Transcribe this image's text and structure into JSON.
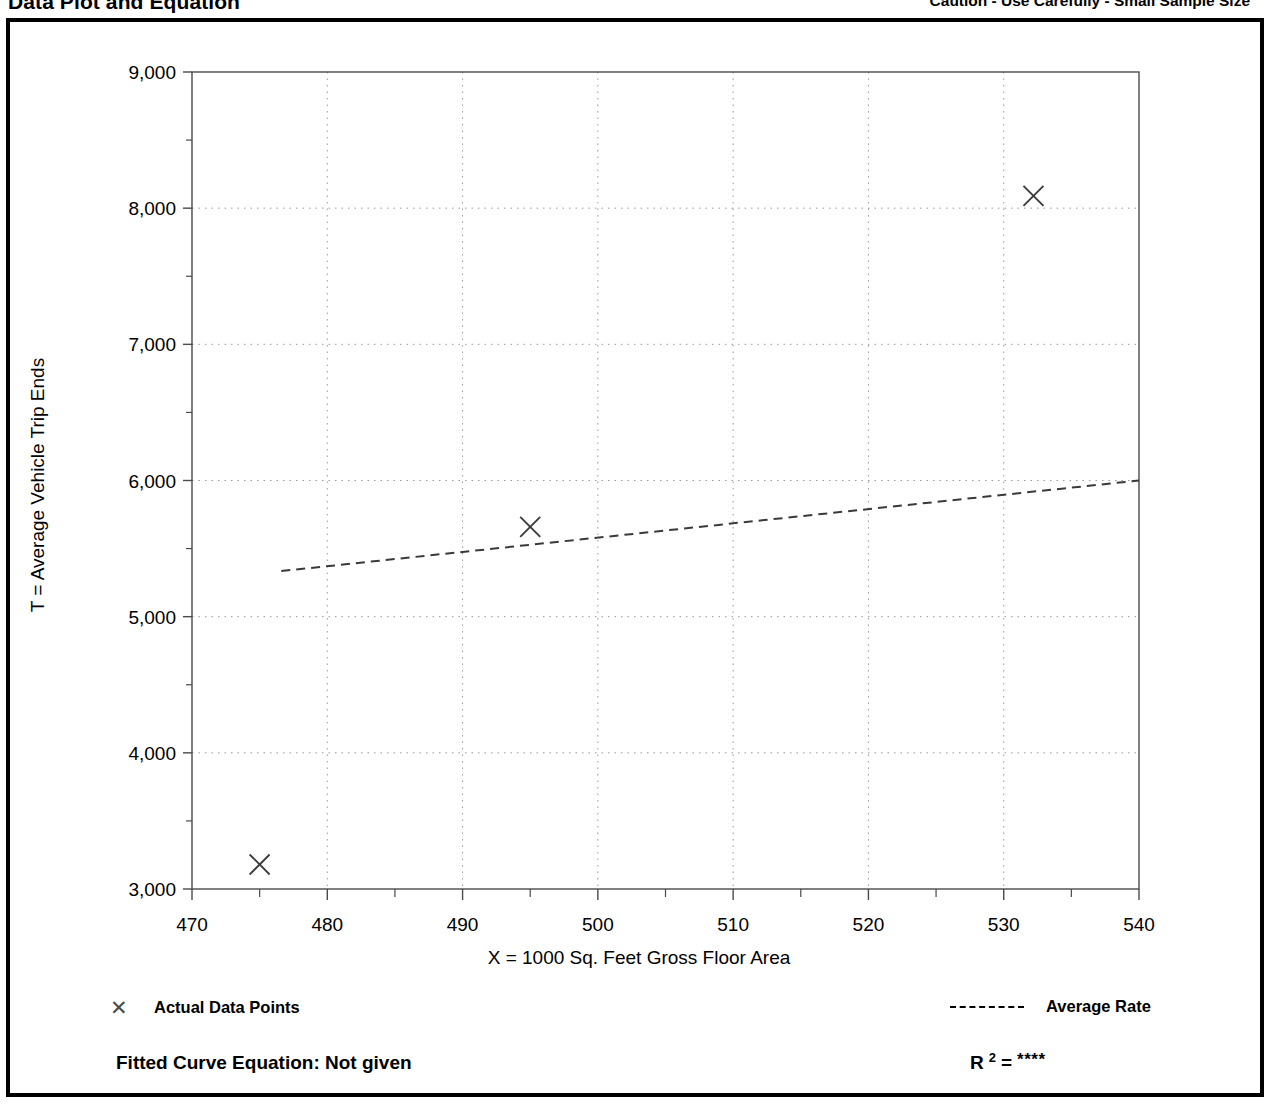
{
  "header": {
    "title": "Data Plot and Equation",
    "caution": "Caution - Use Carefully - Small Sample Size"
  },
  "legend": {
    "points_marker": "✕",
    "points_label": "Actual Data Points",
    "line_label": "Average Rate"
  },
  "equation": {
    "fitted_label": "Fitted Curve Equation:  Not given",
    "r_symbol": "R",
    "r_exponent": "2",
    "r_equals": "=",
    "r_value": "****"
  },
  "chart_data": {
    "type": "scatter",
    "title": "Data Plot and Equation",
    "xlabel": "X = 1000 Sq. Feet Gross Floor Area",
    "ylabel": "T = Average Vehicle Trip Ends",
    "xlim": [
      470,
      540
    ],
    "ylim": [
      3000,
      9000
    ],
    "xticks": [
      470,
      480,
      490,
      500,
      510,
      520,
      530,
      540
    ],
    "xtick_labels": [
      "470",
      "480",
      "490",
      "500",
      "510",
      "520",
      "530",
      "540"
    ],
    "yticks": [
      3000,
      4000,
      5000,
      6000,
      7000,
      8000,
      9000
    ],
    "ytick_labels": [
      "3,000",
      "4,000",
      "5,000",
      "6,000",
      "7,000",
      "8,000",
      "9,000"
    ],
    "x_minor_ticks": [
      475,
      485,
      495,
      505,
      515,
      525,
      535
    ],
    "y_minor_ticks": [
      3500,
      4500,
      5500,
      6500,
      7500,
      8500
    ],
    "grid": true,
    "grid_style": "dotted",
    "legend_position": "below-plot",
    "series": [
      {
        "name": "Actual Data Points",
        "type": "scatter",
        "marker": "x",
        "points": [
          {
            "x": 475.0,
            "y": 3180
          },
          {
            "x": 495.0,
            "y": 5660
          },
          {
            "x": 532.2,
            "y": 8090
          }
        ]
      },
      {
        "name": "Average Rate",
        "type": "line",
        "style": "dashed",
        "points": [
          {
            "x": 476.6,
            "y": 5335
          },
          {
            "x": 540.0,
            "y": 6000
          }
        ]
      }
    ]
  }
}
